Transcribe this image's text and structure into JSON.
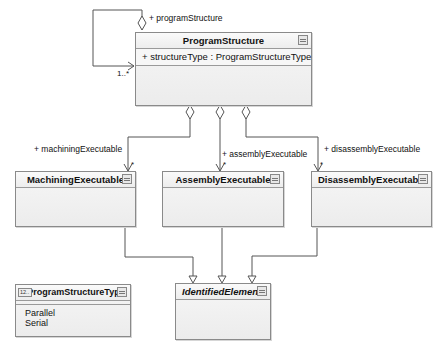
{
  "diagram": {
    "type": "UML class diagram",
    "classes": {
      "program_structure": {
        "name": "ProgramStructure",
        "attributes": [
          "+ structureType : ProgramStructureType"
        ]
      },
      "machining_executable": {
        "name": "MachiningExecutable"
      },
      "assembly_executable": {
        "name": "AssemblyExecutable"
      },
      "disassembly_executable": {
        "name": "DisassemblyExecutable"
      },
      "identified_element": {
        "name": "IdentifiedElement",
        "abstract": true
      },
      "program_structure_type": {
        "name": "ProgramStructureType",
        "stereotype_icon": "12..",
        "kind": "enumeration",
        "literals": [
          "Parallel",
          "Serial"
        ]
      }
    },
    "associations": {
      "self": {
        "role": "+ programStructure",
        "multiplicity": "1..*",
        "kind": "aggregation"
      },
      "machining": {
        "role": "+ machiningExecutable",
        "multiplicity": "*",
        "kind": "aggregation"
      },
      "assembly": {
        "role": "+ assemblyExecutable",
        "multiplicity": "*",
        "kind": "aggregation"
      },
      "disassembly": {
        "role": "+ disassemblyExecutable",
        "multiplicity": "*",
        "kind": "aggregation"
      }
    },
    "generalizations": [
      {
        "from": "MachiningExecutable",
        "to": "IdentifiedElement"
      },
      {
        "from": "AssemblyExecutable",
        "to": "IdentifiedElement"
      },
      {
        "from": "DisassemblyExecutable",
        "to": "IdentifiedElement"
      }
    ],
    "colors": {
      "line": "#555555",
      "box_border": "#8a8a8a",
      "box_fill": "#f2f2f2"
    }
  }
}
